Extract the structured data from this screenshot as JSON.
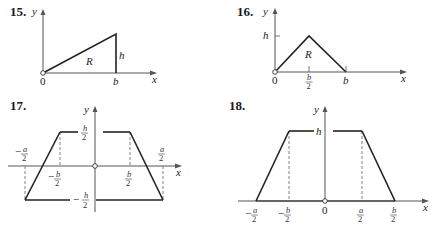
{
  "figures": [
    {
      "number": "15.",
      "axes": {
        "x": "x",
        "y": "y"
      },
      "labels": {
        "origin": "0",
        "b": "b",
        "h": "h",
        "region": "R"
      },
      "shape": "right triangle with vertices (0,0), (b,0), (b,h)"
    },
    {
      "number": "16.",
      "axes": {
        "x": "x",
        "y": "y"
      },
      "labels": {
        "origin": "0",
        "half_b_num": "b",
        "half_b_den": "2",
        "b": "b",
        "h": "h",
        "region": "R"
      },
      "shape": "isosceles triangle with vertices (0,0), (b/2,h), (b,0)"
    },
    {
      "number": "17.",
      "axes": {
        "x": "x",
        "y": "y"
      },
      "labels": {
        "top": {
          "sign": "",
          "num": "h",
          "den": "2"
        },
        "bottom": {
          "sign": "−",
          "num": "h",
          "den": "2"
        },
        "neg_a": {
          "sign": "−",
          "num": "a",
          "den": "2"
        },
        "neg_b": {
          "sign": "−",
          "num": "b",
          "den": "2"
        },
        "pos_b": {
          "sign": "",
          "num": "b",
          "den": "2"
        },
        "pos_a": {
          "sign": "",
          "num": "a",
          "den": "2"
        }
      },
      "shape": "trapezoid centered at origin, top edge from -b/2 to b/2 at h/2, bottom edge from -a/2 to a/2 at -h/2"
    },
    {
      "number": "18.",
      "axes": {
        "x": "x",
        "y": "y"
      },
      "labels": {
        "h": "h",
        "origin": "0",
        "neg_a": {
          "sign": "−",
          "num": "a",
          "den": "2"
        },
        "neg_b": {
          "sign": "−",
          "num": "b",
          "den": "2"
        },
        "pos_a": {
          "sign": "",
          "num": "a",
          "den": "2"
        },
        "pos_b": {
          "sign": "",
          "num": "b",
          "den": "2"
        }
      },
      "shape": "trapezoid on x-axis, top edge from -b/2 to a/2 at height h, base from -a/2 to b/2"
    }
  ]
}
